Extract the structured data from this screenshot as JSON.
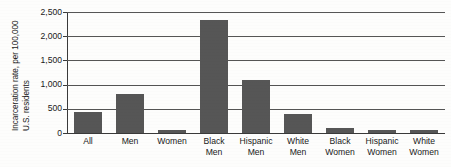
{
  "chart_data": {
    "type": "bar",
    "title": "",
    "xlabel": "",
    "ylabel_line1": "Incarceration rate, per 100,000",
    "ylabel_line2": "U.S. residents",
    "categories": [
      "All",
      "Men",
      "Women",
      "Black Men",
      "Hispanic Men",
      "White Men",
      "Black Women",
      "Hispanic Women",
      "White Women"
    ],
    "category_lines": [
      [
        "All"
      ],
      [
        "Men"
      ],
      [
        "Women"
      ],
      [
        "Black",
        "Men"
      ],
      [
        "Hispanic",
        "Men"
      ],
      [
        "White",
        "Men"
      ],
      [
        "Black",
        "Women"
      ],
      [
        "Hispanic",
        "Women"
      ],
      [
        "White",
        "Women"
      ]
    ],
    "values": [
      430,
      810,
      60,
      2345,
      1090,
      400,
      100,
      65,
      55
    ],
    "ylim": [
      0,
      2500
    ],
    "yticks": [
      0,
      500,
      1000,
      1500,
      2000,
      2500
    ],
    "ytick_labels": [
      "0",
      "500",
      "1,000",
      "1,500",
      "2,000",
      "2,500"
    ],
    "grid": true,
    "legend": "none",
    "bar_color": "#565656",
    "axis_color": "#3a3a3a",
    "grid_color": "#555555",
    "background": "#fdfdfc"
  }
}
